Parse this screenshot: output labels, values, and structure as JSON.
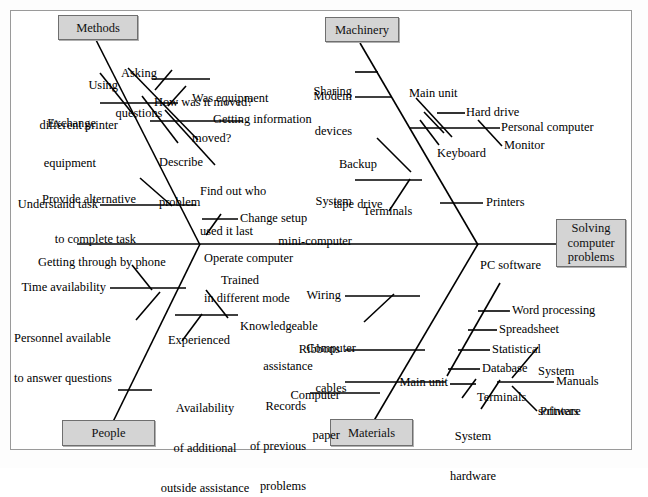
{
  "diagram": {
    "type": "fishbone-ishikawa",
    "effect": {
      "label": "Solving\ncomputer\nproblems",
      "line1": "Solving",
      "line2": "computer",
      "line3": "problems"
    },
    "categories": [
      {
        "id": "methods",
        "label": "Methods",
        "position": "top-left"
      },
      {
        "id": "machinery",
        "label": "Machinery",
        "position": "top-right"
      },
      {
        "id": "people",
        "label": "People",
        "position": "bottom-left"
      },
      {
        "id": "materials",
        "label": "Materials",
        "position": "bottom-right"
      }
    ],
    "causes": {
      "methods": [
        "Using\ndifferent printer",
        "Exchange\nequipment",
        "Asking\nquestions",
        "Was equipment\nmoved?",
        "How was it moved?",
        "Getting information",
        "Describe\nproblem",
        "Find out who\nused it last",
        "Provide alternative\nto complete task",
        "Understand task",
        "Change setup",
        "Operate computer\nin different mode"
      ],
      "machinery": [
        "Sharing\ndevices",
        "Modem",
        "Main unit",
        "Hard drive",
        "Personal computer",
        "Monitor",
        "Keyboard",
        "Backup\ntape drive",
        "System\nmini-computer",
        "Terminals",
        "Printers"
      ],
      "people": [
        "Getting through by phone",
        "Time availability",
        "Personnel available\nto answer questions",
        "Trained",
        "Knowledgeable\nassistance",
        "Experienced",
        "Availability\nof additional\noutside assistance"
      ],
      "materials": [
        "Wiring",
        "Computer\ncables",
        "Ribbons",
        "Computer\npaper",
        "Records\nof previous\nproblems",
        "PC software",
        "Word processing",
        "Spreadsheet",
        "Statistical",
        "Database",
        "Main unit",
        "Terminals",
        "System\nhardware",
        "System\nsoftware",
        "Manuals",
        "Printers"
      ]
    },
    "labels": {
      "methods_box": "Methods",
      "machinery_box": "Machinery",
      "people_box": "People",
      "materials_box": "Materials",
      "using_different_printer_1": "Using",
      "using_different_printer_2": "different printer",
      "exchange_equipment_1": "Exchange",
      "exchange_equipment_2": "equipment",
      "asking_questions_1": "Asking",
      "asking_questions_2": "questions",
      "was_equipment_moved_1": "Was equipment",
      "was_equipment_moved_2": "moved?",
      "how_was_it_moved": "How was it moved?",
      "getting_information": "Getting information",
      "describe_problem_1": "Describe",
      "describe_problem_2": "problem",
      "find_out_who_1": "Find out who",
      "find_out_who_2": "used it last",
      "provide_alternative_1": "Provide alternative",
      "provide_alternative_2": "to complete task",
      "understand_task": "Understand task",
      "change_setup": "Change setup",
      "operate_computer_1": "Operate computer",
      "operate_computer_2": "in different mode",
      "sharing_devices_1": "Sharing",
      "sharing_devices_2": "devices",
      "modem": "Modem",
      "main_unit_mach": "Main unit",
      "hard_drive": "Hard drive",
      "personal_computer": "Personal computer",
      "monitor": "Monitor",
      "keyboard": "Keyboard",
      "backup_tape_1": "Backup",
      "backup_tape_2": "tape drive",
      "system_mini_1": "System",
      "system_mini_2": "mini-computer",
      "terminals_mach": "Terminals",
      "printers_mach": "Printers",
      "getting_through_phone": "Getting through by phone",
      "time_availability": "Time availability",
      "personnel_available_1": "Personnel available",
      "personnel_available_2": "to answer questions",
      "trained": "Trained",
      "knowledgeable_1": "Knowledgeable",
      "knowledgeable_2": "assistance",
      "experienced": "Experienced",
      "availability_1": "Availability",
      "availability_2": "of additional",
      "availability_3": "outside assistance",
      "wiring": "Wiring",
      "computer_cables_1": "Computer",
      "computer_cables_2": "cables",
      "ribbons": "Ribbons",
      "computer_paper_1": "Computer",
      "computer_paper_2": "paper",
      "records_1": "Records",
      "records_2": "of previous",
      "records_3": "problems",
      "pc_software": "PC software",
      "word_processing": "Word processing",
      "spreadsheet": "Spreadsheet",
      "statistical": "Statistical",
      "database": "Database",
      "main_unit_mat": "Main unit",
      "terminals_mat": "Terminals",
      "system_hardware_1": "System",
      "system_hardware_2": "hardware",
      "system_software_1": "System",
      "system_software_2": "software",
      "manuals": "Manuals",
      "printers_mat": "Printers",
      "effect_1": "Solving",
      "effect_2": "computer",
      "effect_3": "problems"
    },
    "colors": {
      "box_fill": "#d4d4d4",
      "box_border": "#6f6f6f",
      "line": "#000000",
      "frame": "#9a9a9a",
      "background": "#ffffff"
    }
  }
}
